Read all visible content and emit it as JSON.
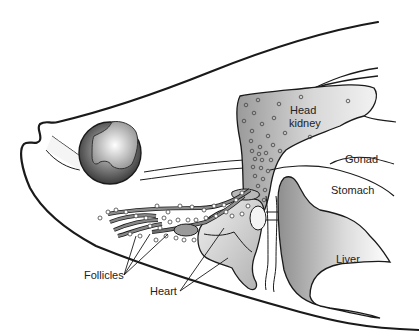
{
  "diagram": {
    "type": "anatomical-illustration",
    "labels": {
      "head_kidney_line1": "Head",
      "head_kidney_line2": "kidney",
      "gonad": "Gonad",
      "stomach": "Stomach",
      "liver": "Liver",
      "follicles": "Follicles",
      "heart": "Heart"
    },
    "colors": {
      "outline": "#1a1a1a",
      "organ_light": "#e6e6e6",
      "organ_mid": "#b5b5b5",
      "organ_dark": "#8a8a8a",
      "eye_dark": "#3a3a3a"
    }
  }
}
